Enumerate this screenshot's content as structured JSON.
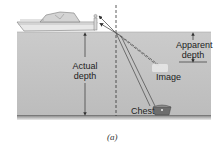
{
  "diagram": {
    "labels": {
      "actual_depth_line1": "Actual",
      "actual_depth_line2": "depth",
      "apparent_depth_line1": "Apparent",
      "apparent_depth_line2": "depth",
      "image": "Image",
      "chest": "Chest"
    },
    "caption": "(a)",
    "colors": {
      "water_top": "#c9c9c9",
      "water_bottom": "#bdbdbd",
      "water_floor": "#6f6f6f",
      "ray": "#555555",
      "boat_hull": "#e6e6e6",
      "text": "#222222"
    },
    "elements": [
      "boat",
      "observer",
      "normal-line",
      "refracted-rays",
      "virtual-rays",
      "chest",
      "image",
      "actual-depth-arrow",
      "apparent-depth-arrow"
    ]
  }
}
